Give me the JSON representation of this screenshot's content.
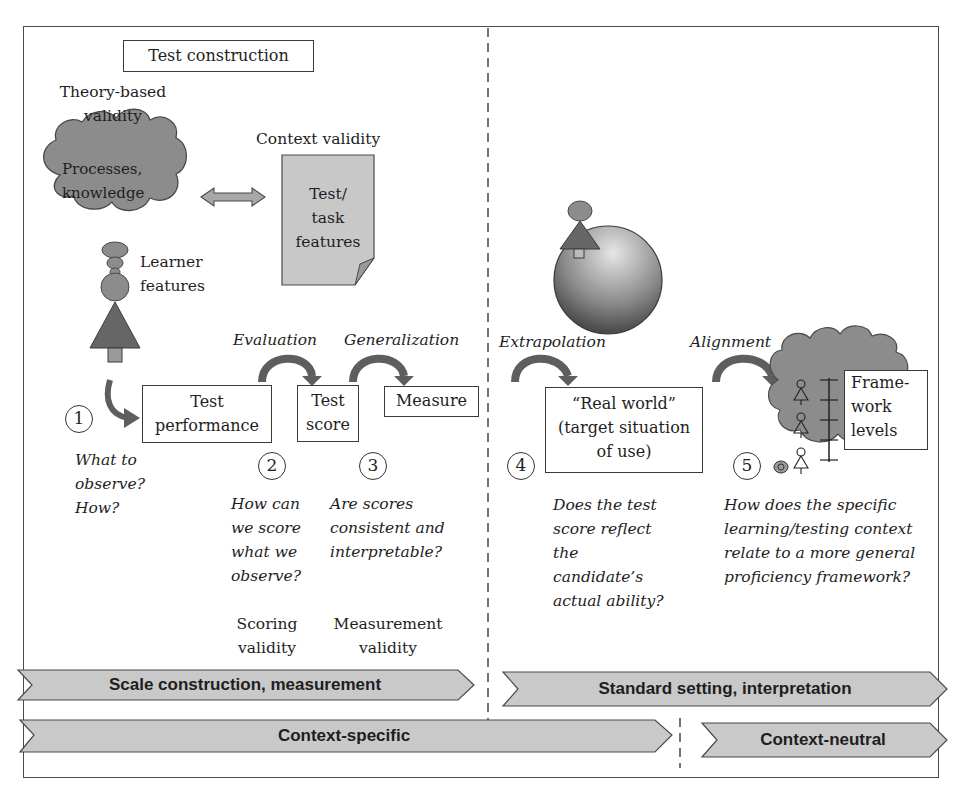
{
  "diagram": {
    "title_box": "Test construction",
    "theory_based_validity": [
      "Theory-based",
      "validity"
    ],
    "cloud_text": [
      "Processes,",
      "knowledge"
    ],
    "context_validity": "Context validity",
    "doc_text": [
      "Test/",
      "task",
      "features"
    ],
    "learner_features": [
      "Learner",
      "features"
    ],
    "arrows": {
      "evaluation": "Evaluation",
      "generalization": "Generalization",
      "extrapolation": "Extrapolation",
      "alignment": "Alignment"
    },
    "boxes": {
      "test_performance": [
        "Test",
        "performance"
      ],
      "test_score": [
        "Test",
        "score"
      ],
      "measure": "Measure",
      "real_world": [
        "“Real world”",
        "(target situation",
        "of use)"
      ],
      "framework_levels": [
        "Frame-",
        "work",
        "levels"
      ]
    },
    "steps": [
      {
        "number": "1",
        "question": [
          "What to",
          "observe?",
          "How?"
        ]
      },
      {
        "number": "2",
        "question": [
          "How can",
          "we score",
          "what we",
          "observe?"
        ],
        "validity": [
          "Scoring",
          "validity"
        ]
      },
      {
        "number": "3",
        "question": [
          "Are scores",
          "consistent and",
          "interpretable?"
        ],
        "validity": [
          "Measurement",
          "validity"
        ]
      },
      {
        "number": "4",
        "question": [
          "Does the test",
          "score reflect",
          "the",
          "candidate’s",
          "actual ability?"
        ]
      },
      {
        "number": "5",
        "question": [
          "How does the specific",
          "learning/testing context",
          "relate to a more general",
          "proficiency framework?"
        ]
      }
    ],
    "chevrons": {
      "scale_construction": "Scale construction, measurement",
      "standard_setting": "Standard setting, interpretation",
      "context_specific": "Context-specific",
      "context_neutral": "Context-neutral"
    },
    "colors": {
      "cloud_fill": "#8c8c8c",
      "figure_dark": "#6a6a6a",
      "doc_fill": "#c8c8c8",
      "chevron_fill": "#c9c9c9",
      "arrow_fill": "#7a7a7a",
      "line": "#3a3a3a"
    }
  }
}
